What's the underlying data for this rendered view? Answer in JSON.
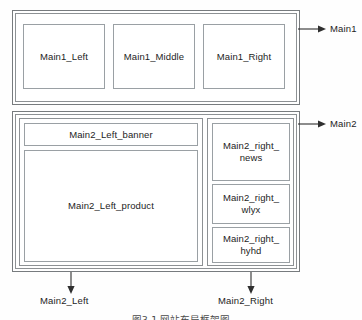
{
  "figure": {
    "caption": "图3-1  网站布局框架图"
  },
  "main1": {
    "label": "Main1",
    "cells": [
      {
        "text": "Main1_Left"
      },
      {
        "text": "Main1_Middle"
      },
      {
        "text": "Main1_Right"
      }
    ]
  },
  "main2": {
    "label": "Main2",
    "left": {
      "label": "Main2_Left",
      "cells": [
        {
          "text": "Main2_Left_banner"
        },
        {
          "text": "Main2_Left_product"
        }
      ]
    },
    "right": {
      "label": "Main2_Right",
      "cells": [
        {
          "text": "Main2_right_\nnews"
        },
        {
          "text": "Main2_right_\nwlyx"
        },
        {
          "text": "Main2_right_\nhyhd"
        }
      ]
    }
  },
  "colors": {
    "background": "#fefefe",
    "box_border": "#8d9194",
    "inner_border": "#9aa0a4",
    "text": "#1d1d1d",
    "arrow": "#2f2f2f"
  }
}
